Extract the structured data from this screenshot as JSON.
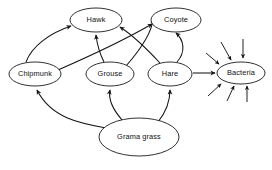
{
  "diagram": {
    "type": "food-web",
    "background_color": "#ffffff",
    "line_color": "#151515",
    "node_fill_color": "#ffffff",
    "nodes": [
      {
        "id": "hawk",
        "label": "Hawk",
        "cx": 96,
        "cy": 20,
        "rx": 26,
        "ry": 12
      },
      {
        "id": "coyote",
        "label": "Coyote",
        "cx": 176,
        "cy": 20,
        "rx": 25,
        "ry": 12
      },
      {
        "id": "chipmunk",
        "label": "Chipmunk",
        "cx": 35,
        "cy": 74,
        "rx": 26,
        "ry": 12
      },
      {
        "id": "grouse",
        "label": "Grouse",
        "cx": 110,
        "cy": 74,
        "rx": 24,
        "ry": 12
      },
      {
        "id": "hare",
        "label": "Hare",
        "cx": 170,
        "cy": 74,
        "rx": 22,
        "ry": 12
      },
      {
        "id": "bacteria",
        "label": "Bacteria",
        "cx": 241,
        "cy": 73,
        "rx": 24,
        "ry": 11
      },
      {
        "id": "grama-grass",
        "label": "Grama grass",
        "cx": 139,
        "cy": 137,
        "rx": 40,
        "ry": 19
      }
    ],
    "edges": [
      {
        "id": "chipmunk-to-hawk",
        "from": "chipmunk",
        "to": "hawk"
      },
      {
        "id": "grouse-to-hawk",
        "from": "grouse",
        "to": "hawk"
      },
      {
        "id": "hare-to-hawk",
        "from": "hare",
        "to": "hawk"
      },
      {
        "id": "chipmunk-to-coyote",
        "from": "chipmunk",
        "to": "coyote"
      },
      {
        "id": "grouse-to-coyote",
        "from": "grouse",
        "to": "coyote"
      },
      {
        "id": "hare-to-coyote",
        "from": "hare",
        "to": "coyote"
      },
      {
        "id": "grama-grass-to-chipmunk",
        "from": "grama-grass",
        "to": "chipmunk"
      },
      {
        "id": "grama-grass-to-grouse",
        "from": "grama-grass",
        "to": "grouse"
      },
      {
        "id": "grama-grass-to-hare",
        "from": "grama-grass",
        "to": "hare"
      },
      {
        "id": "hare-to-bacteria",
        "from": "hare",
        "to": "bacteria"
      },
      {
        "id": "unlabeled-to-bacteria-1",
        "from": "",
        "to": "bacteria"
      },
      {
        "id": "unlabeled-to-bacteria-2",
        "from": "",
        "to": "bacteria"
      },
      {
        "id": "unlabeled-to-bacteria-3",
        "from": "",
        "to": "bacteria"
      },
      {
        "id": "unlabeled-to-bacteria-4",
        "from": "",
        "to": "bacteria"
      },
      {
        "id": "unlabeled-to-bacteria-5",
        "from": "",
        "to": "bacteria"
      },
      {
        "id": "unlabeled-to-bacteria-6",
        "from": "",
        "to": "bacteria"
      }
    ]
  }
}
